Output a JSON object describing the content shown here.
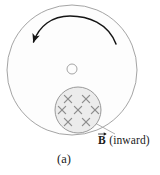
{
  "figure": {
    "caption": "(a)",
    "field_label": {
      "symbol": "B",
      "symbol_decoration": "vector-arrow",
      "qualifier": "(inward)",
      "full_text": "B (inward)"
    },
    "colors": {
      "disk_fill": "#fdfdfd",
      "disk_stroke": "#9a9a9a",
      "field_region_fill": "#ececec",
      "field_region_stroke": "#8f8f8f",
      "cross_mark": "#8c8c8c",
      "arrow": "#151515",
      "leader_line": "#9a9a9a",
      "text": "#1a1a1a",
      "background": "#ffffff"
    },
    "disk": {
      "name": "rotating-disk",
      "center_x": 72,
      "center_y": 70,
      "radius": 65
    },
    "hub": {
      "name": "disk-axle",
      "center_x": 72,
      "center_y": 69,
      "radius": 5
    },
    "rotation_arrow": {
      "name": "counterclockwise-rotation-arrow",
      "direction": "counterclockwise",
      "arrowhead_x": 33,
      "arrowhead_y": 43
    },
    "field_region": {
      "name": "magnetic-field-region",
      "center_x": 78,
      "center_y": 110,
      "radius": 23,
      "field_direction": "into-page",
      "cross_mark_glyph": "×",
      "cross_count": 7,
      "cross_rows": [
        {
          "y": 99,
          "xs": [
            68,
            86
          ]
        },
        {
          "y": 110,
          "xs": [
            62,
            78,
            95
          ]
        },
        {
          "y": 122,
          "xs": [
            68,
            86
          ]
        }
      ]
    },
    "leader_line": {
      "name": "field-label-leader-line",
      "x1": 95,
      "y1": 123,
      "x2": 115,
      "y2": 134
    }
  }
}
